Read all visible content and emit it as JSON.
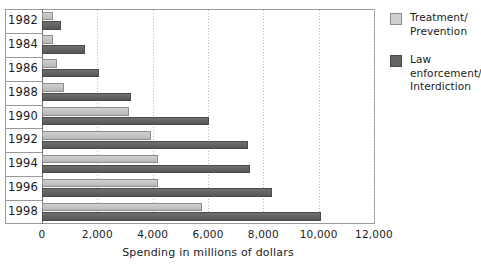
{
  "chart_data": {
    "type": "bar",
    "orientation": "horizontal",
    "title": "",
    "xlabel": "Spending in millions of dollars",
    "ylabel": "",
    "xlim": [
      0,
      12000
    ],
    "xticks": [
      0,
      2000,
      4000,
      6000,
      8000,
      10000,
      12000
    ],
    "xtick_labels": [
      "0",
      "2,000",
      "4,000",
      "6,000",
      "8,000",
      "10,000",
      "12,000"
    ],
    "grid": true,
    "grid_axis": "x",
    "legend_position": "right",
    "categories": [
      "1982",
      "1984",
      "1986",
      "1988",
      "1990",
      "1992",
      "1994",
      "1996",
      "1998"
    ],
    "series": [
      {
        "name": "Treatment/\nPrevention",
        "color": "#c8c8c8",
        "values": [
          400,
          400,
          550,
          800,
          3150,
          3950,
          4200,
          4200,
          5800
        ]
      },
      {
        "name": "Law enforcement/\nInterdiction",
        "color": "#646464",
        "values": [
          700,
          1550,
          2050,
          3200,
          6050,
          7450,
          7500,
          8300,
          10100
        ]
      }
    ]
  },
  "legend": {
    "items": [
      {
        "label_line1": "Treatment/",
        "label_line2": "Prevention",
        "swatch": "treatment"
      },
      {
        "label_line1": "Law enforcement/",
        "label_line2": "Interdiction",
        "swatch": "enforcement"
      }
    ]
  }
}
